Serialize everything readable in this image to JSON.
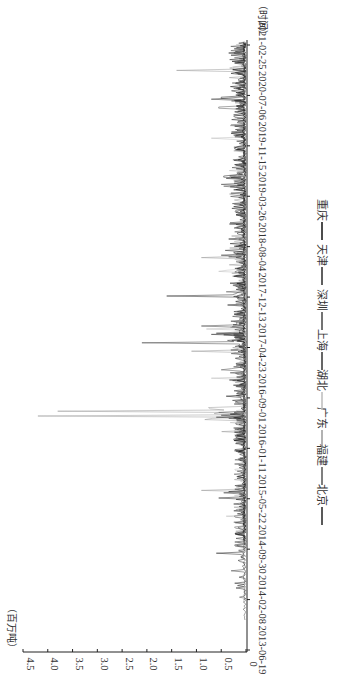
{
  "chart_data": {
    "type": "line",
    "orientation": "rotated-90-clockwise",
    "title": "",
    "xlabel": "（时间）",
    "ylabel": "（百万吨）",
    "ylim": [
      0,
      4.5
    ],
    "y_ticks": [
      "0",
      "0.5",
      "1.0",
      "1.5",
      "2.0",
      "2.5",
      "3.0",
      "3.5",
      "4.0",
      "4.5"
    ],
    "x_ticks": [
      "2013-06-19",
      "2014-02-08",
      "2014-09-30",
      "2015-05-22",
      "2016-01-11",
      "2016-09-01",
      "2017-04-23",
      "2017-12-13",
      "2018-08-04",
      "2019-03-26",
      "2019-11-15",
      "2020-07-06",
      "2021-02-25"
    ],
    "grid": false,
    "legend_position": "right (bottom of unrotated chart)",
    "legend": [
      "北京",
      "福建",
      "广东",
      "湖北",
      "上海",
      "深圳",
      "天津",
      "重庆"
    ],
    "series": [
      {
        "name": "北京",
        "color": "#222222",
        "peaks": [
          {
            "date": "2014-09-10",
            "value": 0.6
          },
          {
            "date": "2015-05-25",
            "value": 0.55
          },
          {
            "date": "2016-06-15",
            "value": 0.5
          },
          {
            "date": "2017-06-20",
            "value": 0.45
          },
          {
            "date": "2018-06-20",
            "value": 0.35
          },
          {
            "date": "2019-06-20",
            "value": 0.3
          },
          {
            "date": "2020-06-25",
            "value": 0.5
          }
        ]
      },
      {
        "name": "福建",
        "color": "#555555",
        "peaks": [
          {
            "date": "2017-01-10",
            "value": 0.5
          },
          {
            "date": "2018-01-05",
            "value": 0.4
          },
          {
            "date": "2019-05-10",
            "value": 0.45
          },
          {
            "date": "2020-05-10",
            "value": 0.55
          }
        ]
      },
      {
        "name": "广东",
        "color": "#999999",
        "peaks": [
          {
            "date": "2014-04-10",
            "value": 2.0
          },
          {
            "date": "2015-07-01",
            "value": 0.9
          },
          {
            "date": "2016-07-01",
            "value": 3.8
          },
          {
            "date": "2016-06-10",
            "value": 4.2
          },
          {
            "date": "2017-04-05",
            "value": 1.1
          },
          {
            "date": "2018-06-15",
            "value": 0.9
          },
          {
            "date": "2020-11-01",
            "value": 1.4
          }
        ]
      },
      {
        "name": "湖北",
        "color": "#bbbbbb",
        "peaks": [
          {
            "date": "2015-03-01",
            "value": 0.4
          },
          {
            "date": "2016-12-01",
            "value": 0.7
          },
          {
            "date": "2017-07-20",
            "value": 0.8
          },
          {
            "date": "2018-04-10",
            "value": 0.55
          },
          {
            "date": "2019-12-20",
            "value": 0.7
          }
        ]
      },
      {
        "name": "上海",
        "color": "#333333",
        "peaks": [
          {
            "date": "2015-06-20",
            "value": 0.45
          },
          {
            "date": "2016-06-05",
            "value": 0.6
          },
          {
            "date": "2017-06-25",
            "value": 0.7
          },
          {
            "date": "2018-06-25",
            "value": 0.5
          },
          {
            "date": "2019-06-15",
            "value": 0.4
          },
          {
            "date": "2020-06-20",
            "value": 0.7
          }
        ]
      },
      {
        "name": "深圳",
        "color": "#444444",
        "peaks": [
          {
            "date": "2014-06-20",
            "value": 0.3
          },
          {
            "date": "2016-06-25",
            "value": 0.55
          },
          {
            "date": "2017-05-15",
            "value": 2.1
          },
          {
            "date": "2017-08-01",
            "value": 0.9
          },
          {
            "date": "2019-05-20",
            "value": 0.5
          }
        ]
      },
      {
        "name": "天津",
        "color": "#2a2a2a",
        "peaks": [
          {
            "date": "2015-06-25",
            "value": 0.35
          },
          {
            "date": "2017-06-28",
            "value": 0.6
          },
          {
            "date": "2017-12-20",
            "value": 1.6
          },
          {
            "date": "2019-06-25",
            "value": 0.45
          }
        ]
      },
      {
        "name": "重庆",
        "color": "#111111",
        "peaks": [
          {
            "date": "2016-09-10",
            "value": 0.4
          },
          {
            "date": "2018-09-10",
            "value": 0.35
          },
          {
            "date": "2020-01-10",
            "value": 0.3
          },
          {
            "date": "2021-01-20",
            "value": 0.35
          }
        ]
      }
    ],
    "notable_points": [
      {
        "date": "2016-06-10",
        "value": 4.2
      },
      {
        "date": "2016-07-01",
        "value": 3.8
      },
      {
        "date": "2017-05-15",
        "value": 2.1
      },
      {
        "date": "2014-04-10",
        "value": 2.0
      },
      {
        "date": "2017-12-20",
        "value": 1.6
      },
      {
        "date": "2020-11-01",
        "value": 1.4
      }
    ]
  },
  "labels": {
    "y_unit": "（百万吨）",
    "x_unit": "（时间）"
  }
}
